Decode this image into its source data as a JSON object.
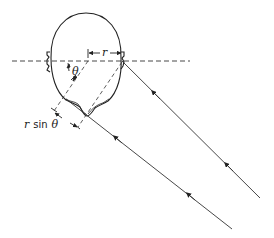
{
  "figure": {
    "type": "geometric diagram",
    "labels": {
      "radius": "r",
      "angle": "θ",
      "path_difference": "r sin θ"
    },
    "elements": {
      "head": "outline of head viewed from above with two ears",
      "interaural_axis": "horizontal dashed line through both ears",
      "incident_rays": "two parallel solid rays with arrows arriving from lower right",
      "construction_lines": "dashed lines parallel to rays through head center and right ear"
    },
    "colors": {
      "stroke": "#222222",
      "background": "#ffffff"
    }
  }
}
